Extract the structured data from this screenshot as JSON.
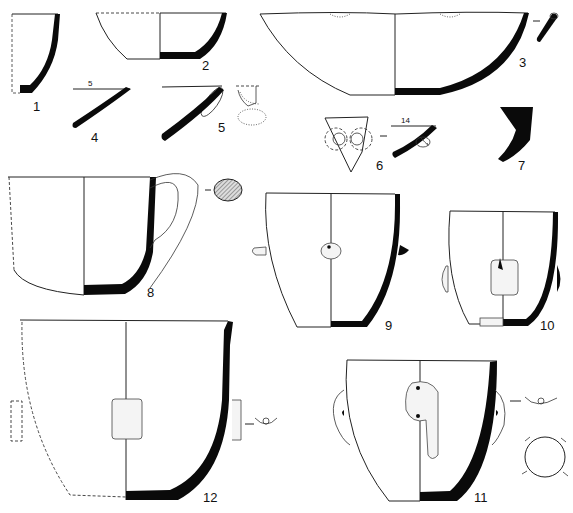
{
  "plate": {
    "description": "Archaeological pottery drawings — vessel profiles and sherds",
    "figures": [
      {
        "id": "fig-1",
        "label": "1",
        "type": "base sherd profile"
      },
      {
        "id": "fig-2",
        "label": "2",
        "type": "shallow bowl"
      },
      {
        "id": "fig-3",
        "label": "3",
        "type": "large shallow bowl with rim section"
      },
      {
        "id": "fig-4",
        "label": "4",
        "type": "rim sherd",
        "annotation": "5"
      },
      {
        "id": "fig-5",
        "label": "5",
        "type": "rim sherd with lug"
      },
      {
        "id": "fig-6",
        "label": "6",
        "type": "sherd with double knobs",
        "annotation": "14"
      },
      {
        "id": "fig-7",
        "label": "7",
        "type": "wall sherd profile"
      },
      {
        "id": "fig-8",
        "label": "8",
        "type": "handled cup with handle section"
      },
      {
        "id": "fig-9",
        "label": "9",
        "type": "pot with knob lugs"
      },
      {
        "id": "fig-10",
        "label": "10",
        "type": "pot with tab lugs"
      },
      {
        "id": "fig-11",
        "label": "11",
        "type": "pot with vertical lug handles and plan view"
      },
      {
        "id": "fig-12",
        "label": "12",
        "type": "deep pot with tubular lug"
      }
    ]
  }
}
